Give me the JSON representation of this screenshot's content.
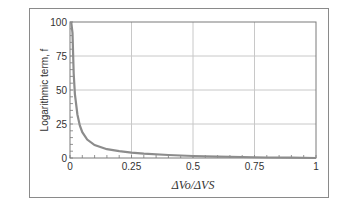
{
  "chart_data": {
    "type": "line",
    "title": "",
    "xlabel": "ΔVo/ΔVS",
    "ylabel": "Logarithmic term, f",
    "xlim": [
      0,
      1
    ],
    "ylim": [
      0,
      100
    ],
    "x_ticks": [
      "0",
      "0.25",
      "0.5",
      "0.75",
      "1"
    ],
    "y_ticks": [
      "0",
      "25",
      "50",
      "75",
      "100"
    ],
    "grid": true,
    "legend": null,
    "series": [
      {
        "name": "f",
        "color": "#8c8c8c",
        "x": [
          0.005,
          0.01,
          0.015,
          0.02,
          0.03,
          0.04,
          0.05,
          0.07,
          0.1,
          0.15,
          0.2,
          0.25,
          0.3,
          0.4,
          0.5,
          0.6,
          0.7,
          0.8,
          0.9,
          1.0
        ],
        "y": [
          100,
          92,
          62,
          47,
          32,
          24,
          19,
          13.5,
          9.5,
          6.5,
          5,
          4,
          3.2,
          2.2,
          1.5,
          1.0,
          0.7,
          0.4,
          0.2,
          0.0
        ]
      }
    ]
  }
}
